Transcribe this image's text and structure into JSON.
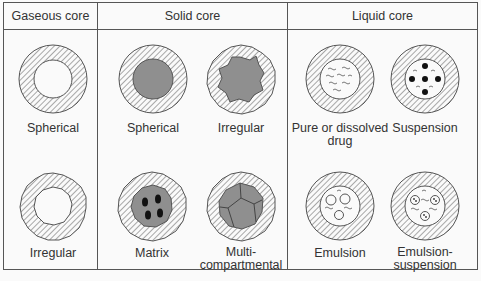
{
  "columns": [
    {
      "title": "Gaseous core",
      "items": [
        {
          "label": "Spherical"
        },
        {
          "label": "Irregular"
        }
      ]
    },
    {
      "title": "Solid core",
      "items": [
        {
          "label": "Spherical"
        },
        {
          "label": "Irregular"
        },
        {
          "label": "Matrix"
        },
        {
          "label": "Multi-\ncompartmental"
        }
      ]
    },
    {
      "title": "Liquid core",
      "items": [
        {
          "label": "Pure or dissolved\ndrug"
        },
        {
          "label": "Suspension"
        },
        {
          "label": "Emulsion"
        },
        {
          "label": "Emulsion-\nsuspension"
        }
      ]
    }
  ],
  "colors": {
    "line": "#555555",
    "core_solid": "#8f8f8f",
    "hatch": "#666666",
    "background": "#fafafa"
  }
}
